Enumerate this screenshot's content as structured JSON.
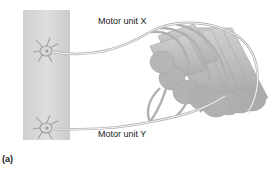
{
  "figure": {
    "panel_label": "(a)",
    "labels": {
      "motor_unit_x": "Motor unit X",
      "motor_unit_y": "Motor unit Y"
    },
    "colors": {
      "spinal_cord": "#d6d6d6",
      "spinal_cord_edge": "#c4c4c4",
      "neuron": "#a8a8a8",
      "axon": "#b4b4b4",
      "muscle_fiber": "#bdbdbd",
      "muscle_fiber_end": "#a9a9a9",
      "text": "#1a1a1a"
    }
  }
}
